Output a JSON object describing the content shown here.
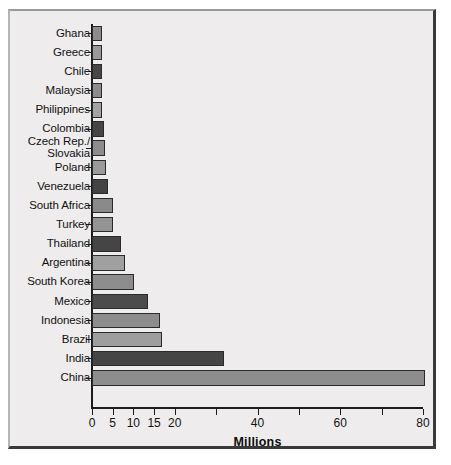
{
  "figure": {
    "background_color": "#eeecec",
    "frame_border_color": "#3a3a3a"
  },
  "chart_data": {
    "type": "bar",
    "orientation": "horizontal",
    "title": "",
    "subtitle": "",
    "xlabel": "Millions",
    "ylabel": "",
    "xlim": [
      0,
      80
    ],
    "grid": false,
    "legend": null,
    "x_ticks": [
      {
        "value": 0,
        "label": "0"
      },
      {
        "value": 5,
        "label": "5"
      },
      {
        "value": 10,
        "label": "10"
      },
      {
        "value": 15,
        "label": "15"
      },
      {
        "value": 20,
        "label": "20"
      },
      {
        "value": 30,
        "label": ""
      },
      {
        "value": 40,
        "label": "40"
      },
      {
        "value": 50,
        "label": ""
      },
      {
        "value": 60,
        "label": "60"
      },
      {
        "value": 70,
        "label": ""
      },
      {
        "value": 80,
        "label": "80"
      }
    ],
    "categories": [
      "Ghana",
      "Greece",
      "Chile",
      "Malaysia",
      "Philippines",
      "Colombia",
      "Czech Rep./\nSlovakia",
      "Poland",
      "Venezuela",
      "South Africa",
      "Turkey",
      "Thailand",
      "Argentina",
      "South Korea",
      "Mexico",
      "Indonesia",
      "Brazil",
      "India",
      "China"
    ],
    "values": [
      2.3,
      2.4,
      2.5,
      2.4,
      2.5,
      2.8,
      3.2,
      3.5,
      3.8,
      5.0,
      5.1,
      7.0,
      8.0,
      10.2,
      13.6,
      16.5,
      17.0,
      32.0,
      80.5
    ],
    "bar_colors": [
      "#8d8d8d",
      "#9a9a9a",
      "#474747",
      "#8d8d8d",
      "#a3a3a3",
      "#454545",
      "#8d8d8d",
      "#9a9a9a",
      "#434343",
      "#8a8a8a",
      "#949494",
      "#454545",
      "#a0a0a0",
      "#8d8d8d",
      "#4c4c4c",
      "#8d8d8d",
      "#9e9e9e",
      "#454545",
      "#8d8d8d"
    ]
  }
}
